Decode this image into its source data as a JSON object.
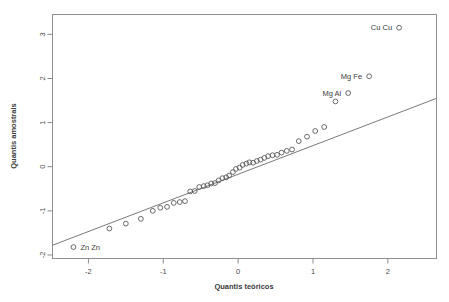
{
  "figure": {
    "kind": "qq-plot",
    "background_color": "#ffffff",
    "frame_color": "#909090",
    "point_color": "#5a5a5a",
    "line_color": "#7a7a7a"
  },
  "chart_data": {
    "type": "scatter",
    "title": "",
    "subtitle": "",
    "xlabel": "Quantis teóricos",
    "ylabel": "Quantis amostrais",
    "grid": false,
    "legend": null,
    "xlim": [
      -2.48,
      2.65
    ],
    "ylim": [
      -2.08,
      3.45
    ],
    "xticks": [
      -2,
      -1,
      0,
      1,
      2
    ],
    "xtick_labels": [
      "-2",
      "-1",
      "0",
      "1",
      "2"
    ],
    "yticks": [
      -2,
      -1,
      0,
      1,
      2,
      3
    ],
    "ytick_labels": [
      "-2",
      "-1",
      "0",
      "1",
      "2",
      "3"
    ],
    "reference_line": {
      "kind": "qqline",
      "x": [
        -2.48,
        2.65
      ],
      "y": [
        -1.78,
        1.55
      ],
      "slope": 0.649,
      "intercept": -0.17
    },
    "series": [
      {
        "name": "sample quantiles",
        "marker": "open-circle",
        "x": [
          -2.2,
          -1.72,
          -1.5,
          -1.3,
          -1.14,
          -1.04,
          -0.95,
          -0.86,
          -0.78,
          -0.71,
          -0.64,
          -0.58,
          -0.52,
          -0.46,
          -0.41,
          -0.36,
          -0.31,
          -0.26,
          -0.21,
          -0.16,
          -0.12,
          -0.07,
          -0.03,
          0.02,
          0.06,
          0.11,
          0.15,
          0.2,
          0.25,
          0.3,
          0.35,
          0.4,
          0.46,
          0.52,
          0.58,
          0.65,
          0.72,
          0.81,
          0.92,
          1.03,
          1.15,
          1.3,
          1.47,
          1.75,
          2.15
        ],
        "y": [
          -1.82,
          -1.4,
          -1.29,
          -1.18,
          -1.0,
          -0.93,
          -0.91,
          -0.82,
          -0.8,
          -0.78,
          -0.56,
          -0.55,
          -0.46,
          -0.44,
          -0.42,
          -0.38,
          -0.37,
          -0.31,
          -0.26,
          -0.24,
          -0.2,
          -0.12,
          -0.05,
          -0.02,
          0.04,
          0.07,
          0.1,
          0.09,
          0.13,
          0.16,
          0.2,
          0.24,
          0.26,
          0.27,
          0.32,
          0.36,
          0.39,
          0.58,
          0.68,
          0.81,
          0.9,
          1.48,
          1.67,
          2.05,
          3.15
        ]
      }
    ],
    "annotations": [
      {
        "text": "Zn Zn",
        "x": -2.2,
        "y": -1.82,
        "position": "right"
      },
      {
        "text": "Mg Al",
        "x": 1.47,
        "y": 1.67,
        "position": "left"
      },
      {
        "text": "Mg Fe",
        "x": 1.75,
        "y": 2.05,
        "position": "left"
      },
      {
        "text": "Cu Cu",
        "x": 2.15,
        "y": 3.15,
        "position": "left"
      }
    ]
  }
}
